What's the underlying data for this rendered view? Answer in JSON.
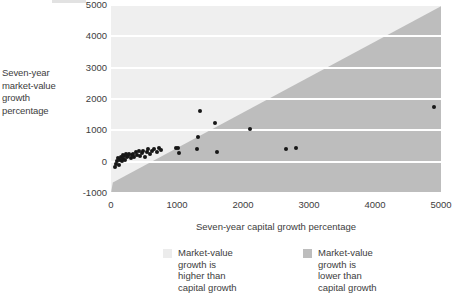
{
  "chart_data": {
    "type": "scatter",
    "title": "",
    "xlabel": "Seven-year capital growth percentage",
    "ylabel": "Seven-year market-value growth percentage",
    "xlim": [
      0,
      5000
    ],
    "ylim": [
      -1000,
      5000
    ],
    "xticks": [
      0,
      1000,
      2000,
      3000,
      4000,
      5000
    ],
    "yticks": [
      -1000,
      0,
      1000,
      2000,
      3000,
      4000,
      5000
    ],
    "xtick_labels": [
      "0",
      "1000",
      "2000",
      "3000",
      "4000",
      "5000"
    ],
    "ytick_labels": [
      "-1000",
      "0",
      "1000",
      "2000",
      "3000",
      "4000",
      "5000"
    ],
    "grid": "horizontal-white-bands",
    "legend_position": "below",
    "reference_line": {
      "name": "y = x diagonal",
      "from": [
        0,
        0
      ],
      "to": [
        5000,
        5000
      ]
    },
    "regions": [
      {
        "name": "market-value growth higher than capital growth",
        "side": "above-diagonal",
        "color": "#efefef"
      },
      {
        "name": "market-value growth lower than capital growth",
        "side": "below-diagonal",
        "color": "#bdbdbd"
      }
    ],
    "series": [
      {
        "name": "Companies",
        "marker": "filled-circle",
        "color": "#171717",
        "points": [
          [
            60,
            -170
          ],
          [
            80,
            -60
          ],
          [
            95,
            30
          ],
          [
            110,
            110
          ],
          [
            120,
            -110
          ],
          [
            135,
            60
          ],
          [
            150,
            150
          ],
          [
            160,
            10
          ],
          [
            175,
            210
          ],
          [
            185,
            100
          ],
          [
            200,
            170
          ],
          [
            215,
            60
          ],
          [
            230,
            230
          ],
          [
            245,
            140
          ],
          [
            260,
            190
          ],
          [
            280,
            240
          ],
          [
            300,
            120
          ],
          [
            315,
            210
          ],
          [
            335,
            260
          ],
          [
            350,
            160
          ],
          [
            375,
            300
          ],
          [
            395,
            215
          ],
          [
            420,
            330
          ],
          [
            440,
            180
          ],
          [
            465,
            280
          ],
          [
            490,
            350
          ],
          [
            515,
            150
          ],
          [
            540,
            300
          ],
          [
            565,
            390
          ],
          [
            590,
            230
          ],
          [
            620,
            330
          ],
          [
            650,
            420
          ],
          [
            690,
            300
          ],
          [
            720,
            430
          ],
          [
            755,
            380
          ],
          [
            980,
            430
          ],
          [
            1010,
            450
          ],
          [
            1030,
            290
          ],
          [
            1300,
            390
          ],
          [
            1320,
            790
          ],
          [
            1355,
            1610
          ],
          [
            1580,
            1220
          ],
          [
            1600,
            320
          ],
          [
            2110,
            1030
          ],
          [
            2650,
            400
          ],
          [
            2800,
            450
          ],
          [
            4900,
            1740
          ]
        ]
      }
    ]
  },
  "axis_titles": {
    "y_lines": [
      "Seven-year",
      "market-value",
      "growth",
      "percentage"
    ],
    "x": "Seven-year capital growth percentage"
  },
  "legend": {
    "items": [
      {
        "swatch": "light",
        "lines": [
          "Market-value",
          "growth is",
          "higher than",
          "capital growth"
        ]
      },
      {
        "swatch": "dark",
        "lines": [
          "Market-value",
          "growth is",
          "lower than",
          "capital growth"
        ]
      }
    ]
  },
  "colors": {
    "region_light": "#efefef",
    "region_dark": "#bdbdbd",
    "gridline": "#ffffff",
    "point": "#171717",
    "text": "#3d3d3d"
  }
}
